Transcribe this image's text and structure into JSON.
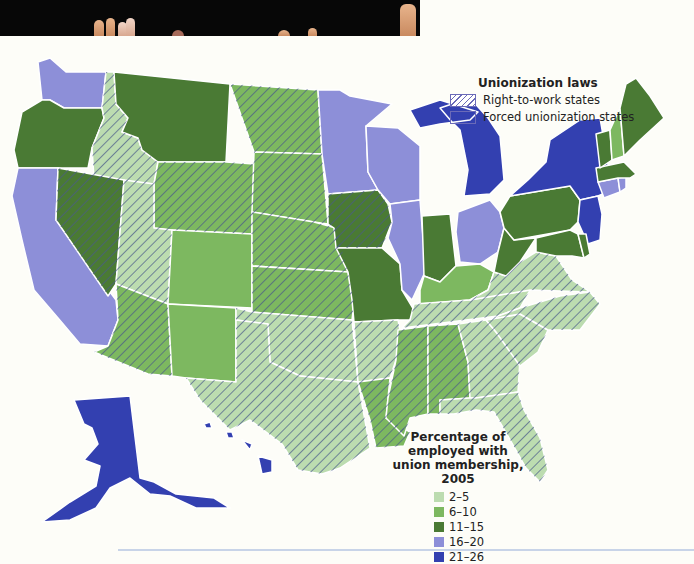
{
  "colors": {
    "c2_5": "#bcdcb0",
    "c6_10": "#7db860",
    "c11_15": "#4a7a34",
    "c16_20": "#8d8fd8",
    "c21_26": "#3340b0",
    "hatch": "#5a6a9a",
    "border": "#ffffff"
  },
  "legend_laws": {
    "title": "Unionization laws",
    "items": [
      {
        "label": "Right-to-work states",
        "pattern": "hatched"
      },
      {
        "label": "Forced unionization states",
        "pattern": "solid"
      }
    ]
  },
  "legend_percentage": {
    "title_line1": "Percentage of employed with",
    "title_line2": "union membership, 2005",
    "items": [
      {
        "label": "2–5",
        "color": "#bcdcb0"
      },
      {
        "label": "6–10",
        "color": "#7db860"
      },
      {
        "label": "11–15",
        "color": "#4a7a34"
      },
      {
        "label": "16–20",
        "color": "#8d8fd8"
      },
      {
        "label": "21–26",
        "color": "#3340b0"
      }
    ]
  },
  "states": [
    {
      "id": "WA",
      "range": "16-20",
      "rtw": false
    },
    {
      "id": "OR",
      "range": "11-15",
      "rtw": false
    },
    {
      "id": "CA",
      "range": "16-20",
      "rtw": false
    },
    {
      "id": "ID",
      "range": "2-5",
      "rtw": true
    },
    {
      "id": "NV",
      "range": "11-15",
      "rtw": true
    },
    {
      "id": "MT",
      "range": "11-15",
      "rtw": false
    },
    {
      "id": "WY",
      "range": "6-10",
      "rtw": true
    },
    {
      "id": "UT",
      "range": "2-5",
      "rtw": true
    },
    {
      "id": "AZ",
      "range": "6-10",
      "rtw": true
    },
    {
      "id": "CO",
      "range": "6-10",
      "rtw": false
    },
    {
      "id": "NM",
      "range": "6-10",
      "rtw": false
    },
    {
      "id": "ND",
      "range": "6-10",
      "rtw": true
    },
    {
      "id": "SD",
      "range": "6-10",
      "rtw": true
    },
    {
      "id": "NE",
      "range": "6-10",
      "rtw": true
    },
    {
      "id": "KS",
      "range": "6-10",
      "rtw": true
    },
    {
      "id": "OK",
      "range": "2-5",
      "rtw": true
    },
    {
      "id": "TX",
      "range": "2-5",
      "rtw": true
    },
    {
      "id": "MN",
      "range": "16-20",
      "rtw": false
    },
    {
      "id": "IA",
      "range": "11-15",
      "rtw": true
    },
    {
      "id": "MO",
      "range": "11-15",
      "rtw": false
    },
    {
      "id": "AR",
      "range": "2-5",
      "rtw": true
    },
    {
      "id": "LA",
      "range": "6-10",
      "rtw": true
    },
    {
      "id": "WI",
      "range": "16-20",
      "rtw": false
    },
    {
      "id": "IL",
      "range": "16-20",
      "rtw": false
    },
    {
      "id": "MI",
      "range": "21-26",
      "rtw": false
    },
    {
      "id": "IN",
      "range": "11-15",
      "rtw": false
    },
    {
      "id": "OH",
      "range": "16-20",
      "rtw": false
    },
    {
      "id": "KY",
      "range": "6-10",
      "rtw": false
    },
    {
      "id": "TN",
      "range": "2-5",
      "rtw": true
    },
    {
      "id": "MS",
      "range": "6-10",
      "rtw": true
    },
    {
      "id": "AL",
      "range": "6-10",
      "rtw": true
    },
    {
      "id": "GA",
      "range": "2-5",
      "rtw": true
    },
    {
      "id": "FL",
      "range": "2-5",
      "rtw": true
    },
    {
      "id": "SC",
      "range": "2-5",
      "rtw": true
    },
    {
      "id": "NC",
      "range": "2-5",
      "rtw": true
    },
    {
      "id": "VA",
      "range": "2-5",
      "rtw": true
    },
    {
      "id": "WV",
      "range": "11-15",
      "rtw": false
    },
    {
      "id": "PA",
      "range": "11-15",
      "rtw": false
    },
    {
      "id": "NY",
      "range": "21-26",
      "rtw": false
    },
    {
      "id": "NJ",
      "range": "21-26",
      "rtw": false
    },
    {
      "id": "MD",
      "range": "11-15",
      "rtw": false
    },
    {
      "id": "DE",
      "range": "11-15",
      "rtw": false
    },
    {
      "id": "CT",
      "range": "16-20",
      "rtw": false
    },
    {
      "id": "RI",
      "range": "16-20",
      "rtw": false
    },
    {
      "id": "MA",
      "range": "11-15",
      "rtw": false
    },
    {
      "id": "VT",
      "range": "11-15",
      "rtw": false
    },
    {
      "id": "NH",
      "range": "6-10",
      "rtw": false
    },
    {
      "id": "ME",
      "range": "11-15",
      "rtw": false
    },
    {
      "id": "AK",
      "range": "21-26",
      "rtw": false
    },
    {
      "id": "HI",
      "range": "21-26",
      "rtw": false
    }
  ]
}
